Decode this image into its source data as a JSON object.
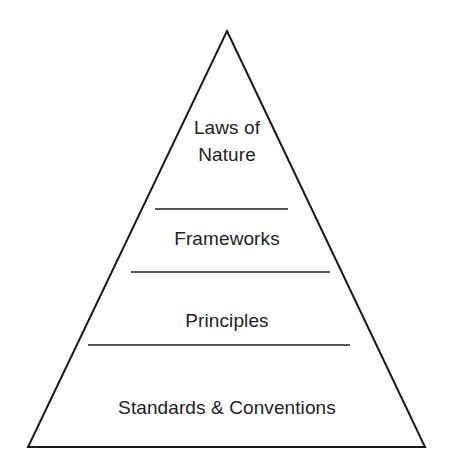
{
  "diagram": {
    "type": "pyramid",
    "title": "",
    "shape_name": "triangle",
    "colors": {
      "background": "#ffffff",
      "outline": "#1a1a1a",
      "divider": "#555555",
      "text": "#222222"
    },
    "geometry": {
      "apex": [
        227,
        31
      ],
      "bottom_left": [
        28,
        447
      ],
      "bottom_right": [
        425,
        447
      ],
      "outline_width": 2,
      "divider_width": 2
    },
    "tiers": [
      {
        "id": "laws-of-nature",
        "label": "Laws of\nNature",
        "label_lines": [
          "Laws of",
          "Nature"
        ],
        "level": 1
      },
      {
        "id": "frameworks",
        "label": "Frameworks",
        "label_lines": [
          "Frameworks"
        ],
        "level": 2
      },
      {
        "id": "principles",
        "label": "Principles",
        "label_lines": [
          "Principles"
        ],
        "level": 3
      },
      {
        "id": "standards-conventions",
        "label": "Standards & Conventions",
        "label_lines": [
          "Standards & Conventions"
        ],
        "level": 4
      }
    ],
    "dividers": [
      {
        "id": "divider-1",
        "y": 209,
        "x1": 155,
        "x2": 288,
        "above": "frameworks"
      },
      {
        "id": "divider-2",
        "y": 272,
        "x1": 131,
        "x2": 330,
        "above": "principles"
      },
      {
        "id": "divider-3",
        "y": 345,
        "x1": 88,
        "x2": 350,
        "above": "standards-conventions"
      }
    ]
  }
}
